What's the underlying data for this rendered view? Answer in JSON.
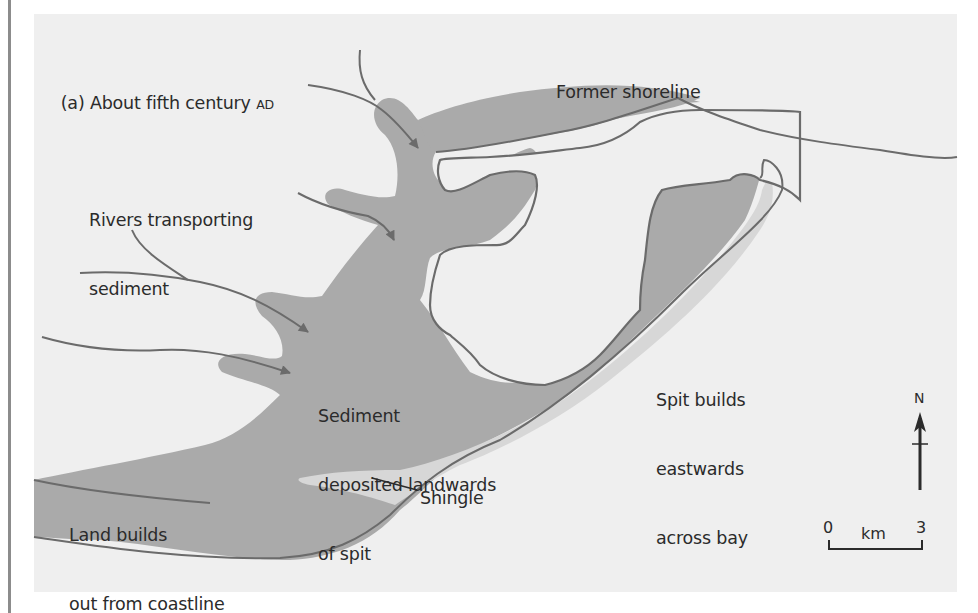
{
  "figure": {
    "panel_title_prefix": "(a) About fifth century ",
    "panel_title_era": "AD"
  },
  "labels": {
    "former_shoreline": "Former shoreline",
    "rivers_line1": "Rivers transporting",
    "rivers_line2": "sediment",
    "sediment_line1": "Sediment",
    "sediment_line2": "deposited landwards",
    "sediment_line3": "of spit",
    "spit_line1": "Spit builds",
    "spit_line2": "eastwards",
    "spit_line3": "across bay",
    "land_line1": "Land builds",
    "land_line2": "out from coastline",
    "shingle": "Shingle"
  },
  "north_arrow": {
    "label": "N",
    "icon": "north-arrow-icon"
  },
  "scale_bar": {
    "start": "0",
    "unit": "km",
    "end": "3"
  },
  "colors": {
    "background_panel": "#efefef",
    "land_fill": "#aaaaaa",
    "shingle_fill": "#d7d7d7",
    "outline": "#6b6b6b",
    "text": "#2b2b2b"
  }
}
